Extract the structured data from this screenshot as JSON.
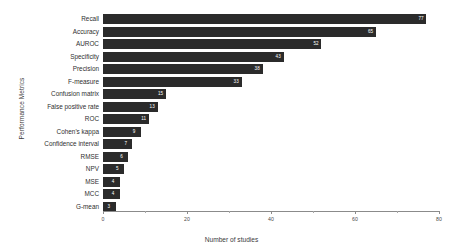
{
  "chart_data": {
    "type": "bar",
    "orientation": "horizontal",
    "title": "",
    "xlabel": "Number of studies",
    "ylabel": "Performance Metrics",
    "xlim": [
      0,
      80
    ],
    "xticks": [
      0,
      20,
      40,
      60,
      80
    ],
    "xticklabels": [
      "0",
      "20",
      "40",
      "60",
      "80"
    ],
    "minor_ticks": [
      10,
      30,
      50,
      70
    ],
    "grid": false,
    "legend": null,
    "bar_color": "#2b2b2b",
    "value_label_color": "#ffffff",
    "categories": [
      "Recall",
      "Accuracy",
      "AUROC",
      "Specificity",
      "Precision",
      "F-measure",
      "Confusion matrix",
      "False positive rate",
      "ROC",
      "Cohen's kappa",
      "Confidence interval",
      "RMSE",
      "NPV",
      "MSE",
      "MCC",
      "G-mean"
    ],
    "values": [
      77,
      65,
      52,
      43,
      38,
      33,
      15,
      13,
      11,
      9,
      7,
      6,
      5,
      4,
      4,
      3
    ],
    "value_labels": [
      "77",
      "65",
      "52",
      "43",
      "38",
      "33",
      "15",
      "13",
      "11",
      "9",
      "7",
      "6",
      "5",
      "4",
      "4",
      "3"
    ]
  }
}
